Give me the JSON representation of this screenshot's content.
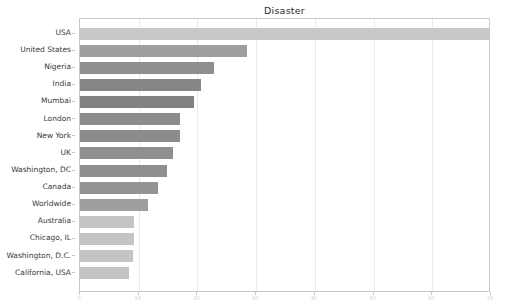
{
  "chart_data": {
    "type": "bar",
    "orientation": "horizontal",
    "title": "Disaster",
    "xlabel": "",
    "ylabel": "",
    "grid": true,
    "legend": null,
    "xlim": [
      0,
      70
    ],
    "xticks": [
      0,
      10,
      20,
      30,
      40,
      50,
      60,
      70
    ],
    "xtick_labels": [
      "0",
      "10",
      "20",
      "30",
      "40",
      "50",
      "60",
      "70"
    ],
    "categories": [
      "USA",
      "United States",
      "Nigeria",
      "India",
      "Mumbai",
      "London",
      "New York",
      "UK",
      "Washington, DC",
      "Canada",
      "Worldwide",
      "Australia",
      "Chicago, IL",
      "Washington, D.C.",
      "California, USA"
    ],
    "values": [
      70,
      28.5,
      22.8,
      20.6,
      19.5,
      17.0,
      17.0,
      15.8,
      14.8,
      13.2,
      11.6,
      9.2,
      9.2,
      9.0,
      8.4
    ],
    "bar_colors": [
      "#c9c9c9",
      "#9e9e9e",
      "#8f8f8f",
      "#868686",
      "#828282",
      "#8c8c8c",
      "#8c8c8c",
      "#8f8f8f",
      "#8f8f8f",
      "#949494",
      "#9e9e9e",
      "#c4c4c4",
      "#c4c4c4",
      "#c4c4c4",
      "#c4c4c4"
    ]
  }
}
